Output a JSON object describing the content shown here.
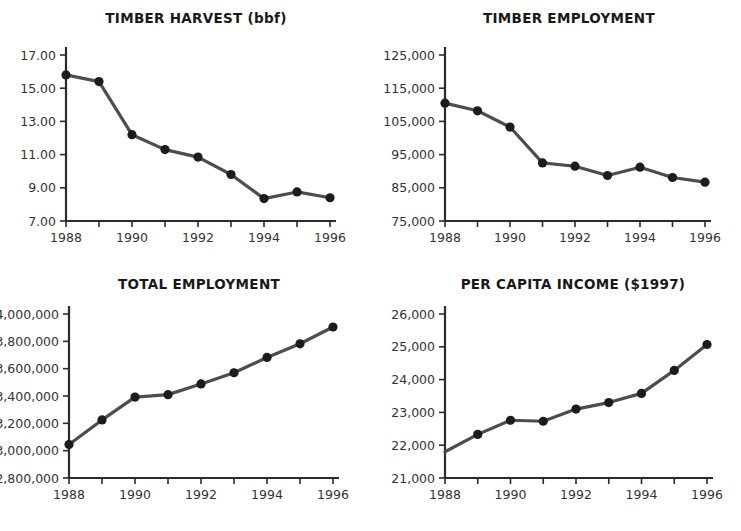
{
  "figure": {
    "background_color": "#ffffff",
    "line_color": "#4d4d4d",
    "marker_color": "#1c1c1c",
    "axis_color": "#2b2b2b",
    "panel_count": 4
  },
  "chart_data": [
    {
      "type": "line",
      "title": "TIMBER HARVEST (bbf)",
      "xlabel": "",
      "ylabel": "",
      "x": [
        1988,
        1989,
        1990,
        1991,
        1992,
        1993,
        1994,
        1995,
        1996
      ],
      "values": [
        15.8,
        15.4,
        12.2,
        11.3,
        10.85,
        9.8,
        8.35,
        8.75,
        8.4
      ],
      "xlim": [
        1988,
        1996
      ],
      "ylim": [
        7.0,
        17.0
      ],
      "yticks": [
        7.0,
        9.0,
        11.0,
        13.0,
        15.0,
        17.0
      ],
      "yticklabels": [
        "7.00",
        "9.00",
        "11.00",
        "13.00",
        "15.00",
        "17.00"
      ],
      "xticks": [
        1988,
        1989,
        1990,
        1991,
        1992,
        1993,
        1994,
        1995,
        1996
      ],
      "xticklabels": [
        "1988",
        "",
        "1990",
        "",
        "1992",
        "",
        "1994",
        "",
        "1996"
      ],
      "grid": false,
      "legend": "none"
    },
    {
      "type": "line",
      "title": "TIMBER EMPLOYMENT",
      "xlabel": "",
      "ylabel": "",
      "x": [
        1988,
        1989,
        1990,
        1991,
        1992,
        1993,
        1994,
        1995,
        1996
      ],
      "values": [
        110500,
        108200,
        103300,
        92500,
        91500,
        88700,
        91200,
        88100,
        86700
      ],
      "xlim": [
        1988,
        1996
      ],
      "ylim": [
        75000,
        125000
      ],
      "yticks": [
        75000,
        85000,
        95000,
        105000,
        115000,
        125000
      ],
      "yticklabels": [
        "75,000",
        "85,000",
        "95,000",
        "105,000",
        "115,000",
        "125,000"
      ],
      "xticks": [
        1988,
        1989,
        1990,
        1991,
        1992,
        1993,
        1994,
        1995,
        1996
      ],
      "xticklabels": [
        "1988",
        "",
        "1990",
        "",
        "1992",
        "",
        "1994",
        "",
        "1996"
      ],
      "grid": false,
      "legend": "none"
    },
    {
      "type": "line",
      "title": "TOTAL EMPLOYMENT",
      "xlabel": "",
      "ylabel": "",
      "x": [
        1988,
        1989,
        1990,
        1991,
        1992,
        1993,
        1994,
        1995,
        1996
      ],
      "values": [
        3045000,
        3225000,
        3392000,
        3410000,
        3488000,
        3570000,
        3682000,
        3782000,
        3905000
      ],
      "xlim": [
        1988,
        1996
      ],
      "ylim": [
        2800000,
        4000000
      ],
      "yticks": [
        2800000,
        3000000,
        3200000,
        3400000,
        3600000,
        3800000,
        4000000
      ],
      "yticklabels": [
        "2,800,000",
        "3,000,000",
        "3,200,000",
        "3,400,000",
        "3,600,000",
        "3,800,000",
        "4,000,000"
      ],
      "xticks": [
        1988,
        1989,
        1990,
        1991,
        1992,
        1993,
        1994,
        1995,
        1996
      ],
      "xticklabels": [
        "1988",
        "",
        "1990",
        "",
        "1992",
        "",
        "1994",
        "",
        "1996"
      ],
      "grid": false,
      "legend": "none"
    },
    {
      "type": "line",
      "title": "PER CAPITA INCOME ($1997)",
      "xlabel": "",
      "ylabel": "",
      "x": [
        1988,
        1989,
        1990,
        1991,
        1992,
        1993,
        1994,
        1995,
        1996
      ],
      "values": [
        21800,
        22330,
        22760,
        22730,
        23100,
        23300,
        23580,
        24280,
        25070
      ],
      "xlim": [
        1988,
        1996
      ],
      "ylim": [
        21000,
        26000
      ],
      "yticks": [
        21000,
        22000,
        23000,
        24000,
        25000,
        26000
      ],
      "yticklabels": [
        "21,000",
        "22,000",
        "23,000",
        "24,000",
        "25,000",
        "26,000"
      ],
      "xticks": [
        1988,
        1989,
        1990,
        1991,
        1992,
        1993,
        1994,
        1995,
        1996
      ],
      "xticklabels": [
        "1988",
        "",
        "1990",
        "",
        "1992",
        "",
        "1994",
        "",
        "1996"
      ],
      "grid": false,
      "legend": "none"
    }
  ]
}
